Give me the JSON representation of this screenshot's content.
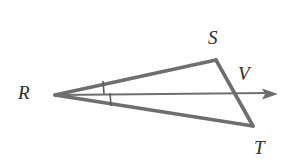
{
  "figure": {
    "background_color": "#ffffff",
    "stroke_color": "#6e6e6e",
    "label_color": "#2b2b2b",
    "labels": {
      "R": "R",
      "S": "S",
      "T": "T",
      "V": "V"
    },
    "points": {
      "R": {
        "x": 55,
        "y": 95
      },
      "S": {
        "x": 216,
        "y": 60
      },
      "T": {
        "x": 253,
        "y": 126
      },
      "V_arrow_tip": {
        "x": 278,
        "y": 94
      },
      "ST_ray_intersection": {
        "x": 238,
        "y": 94
      }
    },
    "segments": [
      {
        "name": "RS",
        "from": "R",
        "to": "S",
        "stroke_width": 3.6
      },
      {
        "name": "ST",
        "from": "S",
        "to": "T",
        "stroke_width": 3.6
      },
      {
        "name": "RT",
        "from": "R",
        "to": "T",
        "stroke_width": 3.6
      },
      {
        "name": "RV",
        "from": "R",
        "to": "V_arrow_tip",
        "stroke_width": 2.0,
        "arrow": true
      }
    ],
    "tick_marks": [
      {
        "name": "upper-angle-tick",
        "x": 103,
        "y1": 81,
        "y2": 94
      },
      {
        "name": "lower-angle-tick",
        "x": 110,
        "y1": 93,
        "y2": 106
      }
    ]
  }
}
